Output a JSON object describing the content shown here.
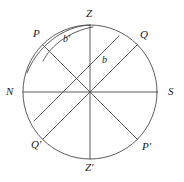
{
  "figure": {
    "kind": "celestial-sphere-meridian-diagram",
    "stroke_color": "#4a4a4a",
    "label_color": "#1b1b1b",
    "background_color": "#ffffff",
    "circle": {
      "cx": 90,
      "cy": 92,
      "r": 67
    },
    "labels": {
      "zenith": "Z",
      "nadir": "Z'",
      "north": "N",
      "south": "S",
      "pole": "P",
      "pole_opposite": "P'",
      "equator_point": "Q",
      "equator_point_opposite": "Q'",
      "arc_b": "b",
      "arc_b_prime": "b'"
    },
    "axes": [
      {
        "name": "vertical-axis",
        "from": "Z",
        "to": "Z'"
      },
      {
        "name": "horizontal-axis",
        "from": "N",
        "to": "S"
      },
      {
        "name": "polar-axis",
        "from": "P",
        "to": "P'"
      },
      {
        "name": "equatorial-axis",
        "from": "Q",
        "to": "Q'"
      }
    ]
  }
}
